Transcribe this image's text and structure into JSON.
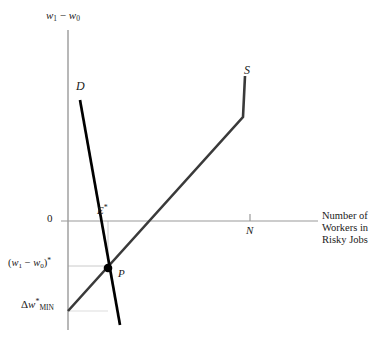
{
  "figure": {
    "type": "economics-supply-demand-diagram",
    "title": "",
    "axes": {
      "y_axis_label": "w₁ − w₀",
      "y_axis_label_parts": {
        "w": "w",
        "sub1": "1",
        "minus": "−",
        "sub0": "0"
      },
      "x_axis_label": "Number of Workers in Risky Jobs",
      "x_axis_label_lines": [
        "Number of",
        "Workers in",
        "Risky Jobs"
      ],
      "origin_label": "0"
    },
    "curves": [
      {
        "name": "demand",
        "label": "D",
        "description": "steep downward-sloping demand curve",
        "color": "#000000",
        "width": 2.6,
        "points": [
          [
            80,
            100
          ],
          [
            120,
            325
          ]
        ]
      },
      {
        "name": "supply",
        "label": "S",
        "description": "upward-sloping supply curve with vertical segment at top",
        "color": "#3a3a3a",
        "width": 2.6,
        "points": [
          [
            68,
            311
          ],
          [
            243,
            117
          ],
          [
            245,
            76
          ]
        ]
      }
    ],
    "points": [
      {
        "name": "equilibrium",
        "label": "P",
        "x": 108,
        "y": 268,
        "marker": "filled-circle"
      }
    ],
    "tick_labels": [
      {
        "name": "employment-equilibrium",
        "label": "E",
        "superscript": "*",
        "axis": "x",
        "x": 108
      },
      {
        "name": "total-workers",
        "label": "N",
        "axis": "x",
        "x": 250
      }
    ],
    "value_labels": [
      {
        "name": "equilibrium-wage-differential",
        "text": "(w₁ − w₀)*",
        "axis": "y",
        "y": 266
      },
      {
        "name": "minimum-wage-differential",
        "text": "Δw*MIN",
        "axis": "y",
        "y": 311
      }
    ],
    "colors": {
      "axis": "#9a9a9a",
      "demand": "#000000",
      "supply": "#3a3a3a",
      "guide": "#bdbdbd",
      "text": "#1a1a1a",
      "background": "#ffffff"
    }
  }
}
